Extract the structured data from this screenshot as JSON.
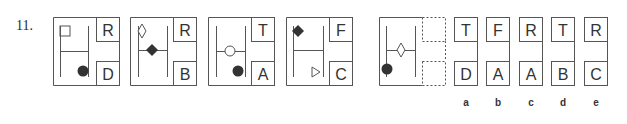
{
  "question": {
    "number": "11."
  },
  "colors": {
    "stroke": "#555555",
    "fill": "#333333",
    "background": "#ffffff"
  },
  "sequence": [
    {
      "x": 53,
      "top_letter": "R",
      "bottom_letter": "D",
      "shapes": [
        {
          "type": "square-outline",
          "cx": 65,
          "cy": 31
        },
        {
          "type": "circle-filled",
          "cx": 83,
          "cy": 71
        }
      ],
      "crossbar_y": 51,
      "left_line": 60,
      "right_line": 88
    },
    {
      "x": 130,
      "top_letter": "R",
      "bottom_letter": "B",
      "shapes": [
        {
          "type": "diamond-outline",
          "cx": 142,
          "cy": 31
        },
        {
          "type": "diamond-filled",
          "cx": 152,
          "cy": 50
        }
      ],
      "crossbar_y": 50,
      "left_line": 138,
      "right_line": 167
    },
    {
      "x": 208,
      "top_letter": "T",
      "bottom_letter": "A",
      "shapes": [
        {
          "type": "circle-outline",
          "cx": 230,
          "cy": 51
        },
        {
          "type": "circle-filled",
          "cx": 238,
          "cy": 71
        }
      ],
      "crossbar_y": 51,
      "left_line": 216,
      "right_line": 245
    },
    {
      "x": 286,
      "top_letter": "F",
      "bottom_letter": "C",
      "shapes": [
        {
          "type": "diamond-filled",
          "cx": 298,
          "cy": 31
        },
        {
          "type": "triangle-right-outline",
          "cx": 316,
          "cy": 72
        }
      ],
      "crossbar_y": 50,
      "left_line": 293,
      "right_line": 323
    }
  ],
  "question_panel": {
    "x": 379,
    "shapes": [
      {
        "type": "diamond-outline",
        "cx": 401,
        "cy": 50
      },
      {
        "type": "circle-filled",
        "cx": 387,
        "cy": 69
      }
    ],
    "crossbar_y": 50,
    "left_line": 386,
    "right_line": 415
  },
  "options": [
    {
      "label": "a",
      "x": 454,
      "top_letter": "T",
      "bottom_letter": "D"
    },
    {
      "label": "b",
      "x": 486,
      "top_letter": "F",
      "bottom_letter": "A"
    },
    {
      "label": "c",
      "x": 519,
      "top_letter": "R",
      "bottom_letter": "A"
    },
    {
      "label": "d",
      "x": 551,
      "top_letter": "T",
      "bottom_letter": "B"
    },
    {
      "label": "e",
      "x": 584,
      "top_letter": "R",
      "bottom_letter": "C"
    }
  ]
}
